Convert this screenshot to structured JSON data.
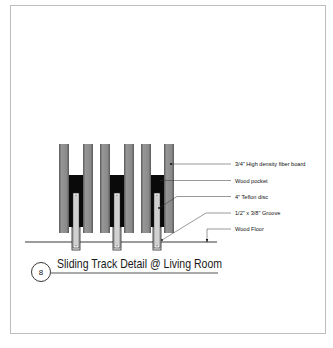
{
  "drawing": {
    "title": "Sliding Track Detail @ Living Room",
    "detail_number": "8",
    "labels": {
      "fiber_board": "3/4\" High density fiber board",
      "wood_pocket": "Wood pocket",
      "teflon_disc": "4\" Teflon disc",
      "groove": "1/2\" x 3/8\" Groove",
      "wood_floor": "Wood Floor"
    },
    "colors": {
      "board_fill": "#8c8c8c",
      "board_edge": "#4a4a4a",
      "pocket_fill": "#0a0a0a",
      "disc_fill": "#ffffff",
      "line": "#222222",
      "frame": "#bdbdbd"
    },
    "panel_count": 3
  }
}
